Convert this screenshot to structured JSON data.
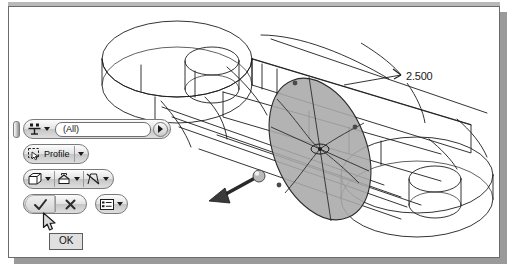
{
  "window": {
    "title": "",
    "background_color": "#ffffff",
    "border_color": "#6b6b6b",
    "shadow_color": "#9a9a9a"
  },
  "viewport": {
    "name": "cad-3d-viewport",
    "model_description": "isometric wireframe of a two-lobe link plate with cylindrical bosses",
    "line_color": "#1d1d1d",
    "preview_fill": "#a8a8a8",
    "preview_stroke": "#2a2a2a"
  },
  "dimension": {
    "value": "2.500",
    "name": "extrude-distance-dimension"
  },
  "command_bar": {
    "name": "extrude-command-bar",
    "rows": [
      {
        "name": "selection-filter-row",
        "grip": "drag-grip",
        "filter_icon": "select-filter-icon",
        "field_value": "(All)",
        "field_placeholder": "(All)",
        "expand_icon": "expand-right-icon"
      },
      {
        "name": "profile-row",
        "icon": "profile-pick-icon",
        "label": "Profile",
        "dropdown_icon": "chevron-down-icon"
      },
      {
        "name": "options-row",
        "buttons": [
          {
            "icon": "solid-extrude-icon",
            "dropdown_icon": "chevron-down-icon",
            "label": ""
          },
          {
            "icon": "output-surface-icon",
            "dropdown_icon": "chevron-down-icon",
            "label": ""
          },
          {
            "icon": "no-taper-icon",
            "dropdown_icon": "chevron-down-icon",
            "label": ""
          }
        ]
      },
      {
        "name": "confirm-row",
        "ok_icon": "check-icon",
        "cancel_icon": "close-icon",
        "more_icon": "more-options-icon",
        "more_dropdown_icon": "chevron-down-icon"
      }
    ]
  },
  "tooltip": {
    "name": "ok-tooltip",
    "text": "OK"
  },
  "cursor": {
    "name": "mouse-cursor",
    "type": "arrow",
    "x": 33,
    "y": 205
  },
  "manipulator": {
    "name": "direction-arrow-handle",
    "description": "extrude direction arrow with spherical drag handle"
  }
}
